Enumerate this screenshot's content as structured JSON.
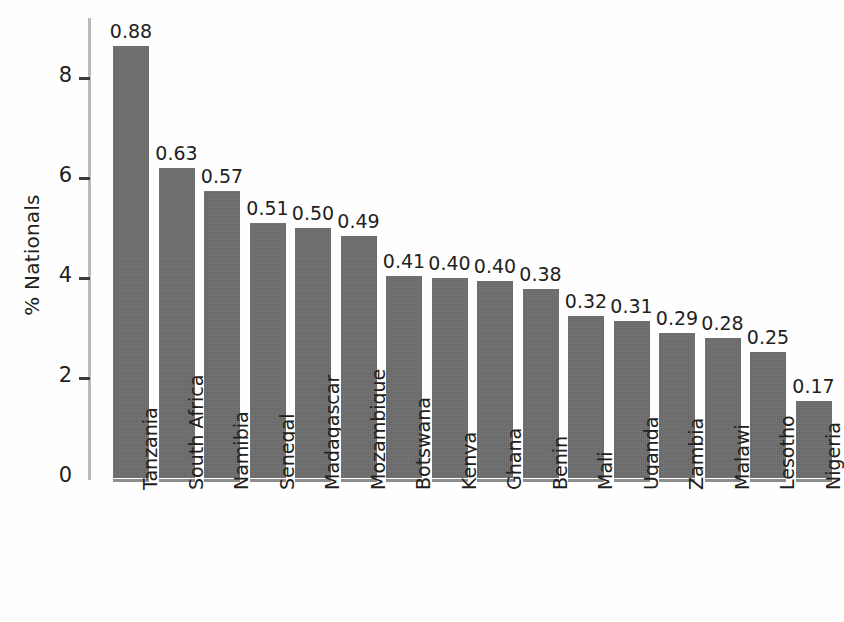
{
  "chart_data": {
    "type": "bar",
    "title": "",
    "subtitle": "",
    "xlabel": "",
    "ylabel": "% Nationals",
    "ylim": [
      0,
      9.2
    ],
    "yticks": [
      0,
      2,
      4,
      6,
      8
    ],
    "ytick_labels": [
      "0",
      "2",
      "4",
      "6",
      "8"
    ],
    "grid": false,
    "legend": null,
    "bar_color": "#6d6d6d",
    "text_color": "#231f20",
    "axis_color": "#b9b9b9",
    "categories": [
      "Tanzania",
      "South Africa",
      "Namibia",
      "Senegal",
      "Madagascar",
      "Mozambique",
      "Botswana",
      "Kenya",
      "Ghana",
      "Benin",
      "Mali",
      "Uganda",
      "Zambia",
      "Malawi",
      "Lesotho",
      "Nigeria"
    ],
    "values": [
      8.65,
      6.2,
      5.75,
      5.1,
      5.0,
      4.85,
      4.05,
      4.0,
      3.95,
      3.78,
      3.25,
      3.15,
      2.9,
      2.8,
      2.53,
      1.55
    ],
    "data_labels": [
      "0.88",
      "0.63",
      "0.57",
      "0.51",
      "0.50",
      "0.49",
      "0.41",
      "0.40",
      "0.40",
      "0.38",
      "0.32",
      "0.31",
      "0.29",
      "0.28",
      "0.25",
      "0.17"
    ]
  }
}
